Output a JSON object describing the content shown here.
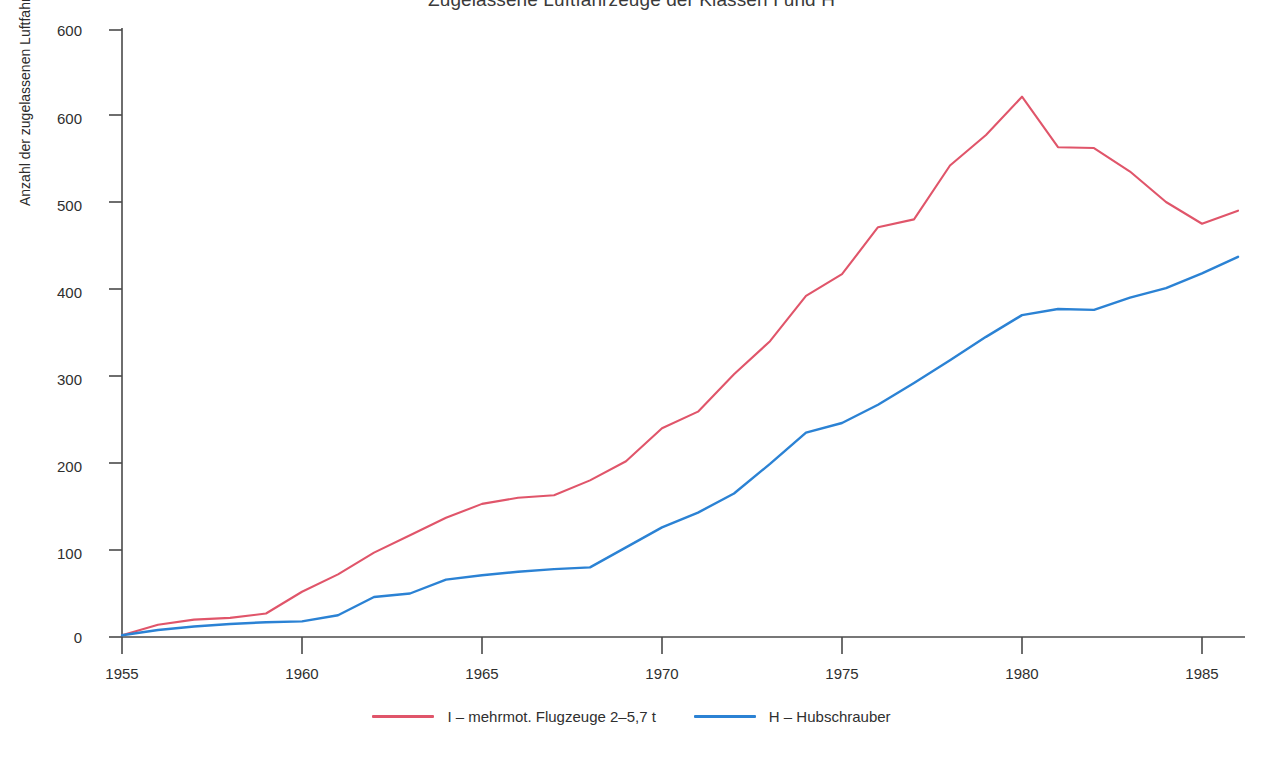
{
  "title": "Zugelassene Luftfahrzeuge der Klassen I und H",
  "axes": {
    "ylabel": "Anzahl der zugelassenen Luftfahrzeuge",
    "xlabel": ""
  },
  "legend": {
    "entries": [
      {
        "label": "I – mehrmot. Flugzeuge 2–5,7 t",
        "color": "#e0556a",
        "swatch": "line-swatch-red"
      },
      {
        "label": "H – Hubschrauber",
        "color": "#2b82d4",
        "swatch": "line-swatch-blue"
      }
    ]
  },
  "chart_data": {
    "type": "line",
    "title": "Zugelassene Luftfahrzeuge der Klassen I und H",
    "xlabel": "",
    "ylabel": "Anzahl der zugelassenen Luftfahrzeuge",
    "xlim": [
      1955,
      1986
    ],
    "ylim": [
      0,
      600
    ],
    "grid": false,
    "legend_position": "bottom",
    "xticks": [
      1955,
      1960,
      1965,
      1970,
      1975,
      1980,
      1985
    ],
    "xticklabels": [
      "1955",
      "1960",
      "1965",
      "1970",
      "1975",
      "1980",
      "1985"
    ],
    "yticks": [
      0,
      100,
      200,
      300,
      400,
      500,
      600
    ],
    "yticklabels": [
      "0",
      "100",
      "200",
      "300",
      "400",
      "500",
      "600"
    ],
    "extra_ytick_artifact": {
      "label": "600",
      "note": "duplicate 600 label printed near top of axis in the original scan",
      "y_pixel": 30
    },
    "x": [
      1955,
      1956,
      1957,
      1958,
      1959,
      1960,
      1961,
      1962,
      1963,
      1964,
      1965,
      1966,
      1967,
      1968,
      1969,
      1970,
      1971,
      1972,
      1973,
      1974,
      1975,
      1976,
      1977,
      1978,
      1979,
      1980,
      1981,
      1982,
      1983,
      1984,
      1985,
      1986
    ],
    "series": [
      {
        "name": "I – mehrmot. Flugzeuge 2–5,7 t",
        "color": "#e0556a",
        "values": [
          2,
          14,
          20,
          22,
          27,
          52,
          72,
          97,
          117,
          137,
          153,
          160,
          163,
          180,
          202,
          240,
          259,
          302,
          340,
          392,
          417,
          471,
          480,
          542,
          577,
          621,
          563,
          562,
          535,
          500,
          475,
          490
        ]
      },
      {
        "name": "H – Hubschrauber",
        "color": "#2b82d4",
        "values": [
          2,
          8,
          12,
          15,
          17,
          18,
          25,
          46,
          50,
          66,
          71,
          75,
          78,
          80,
          103,
          126,
          143,
          165,
          199,
          235,
          246,
          267,
          292,
          318,
          345,
          370,
          377,
          376,
          390,
          401,
          418,
          437
        ]
      }
    ]
  }
}
